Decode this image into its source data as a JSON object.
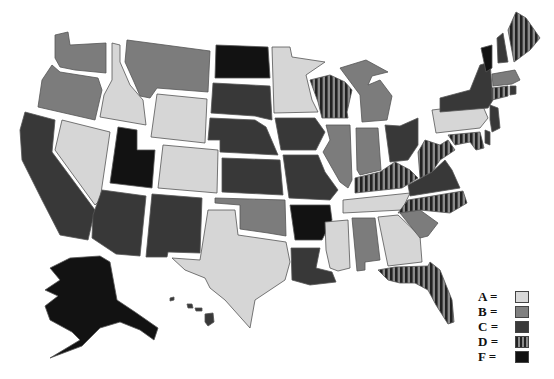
{
  "legend": {
    "items": [
      {
        "grade": "A",
        "label": "A =",
        "fill": "#d9d9d9"
      },
      {
        "grade": "B",
        "label": "B =",
        "fill": "#808080"
      },
      {
        "grade": "C",
        "label": "C =",
        "fill": "#3a3a3a"
      },
      {
        "grade": "D",
        "label": "D =",
        "fill": "url(#stripes)"
      },
      {
        "grade": "F",
        "label": "F =",
        "fill": "#111111"
      }
    ]
  },
  "colors": {
    "A": "#d6d6d6",
    "B": "#7c7c7c",
    "C": "#383838",
    "D": "url(#stripes)",
    "F": "#121212",
    "stripe_light": "#8a8a8a",
    "stripe_dark": "#222222"
  },
  "states": [
    {
      "code": "WA",
      "grade": "B",
      "points": "55,35 68,32 70,45 106,43 106,73 75,70 60,67 55,58"
    },
    {
      "code": "OR",
      "grade": "B",
      "points": "52,65 60,72 98,78 102,90 95,120 38,107 42,80"
    },
    {
      "code": "ID",
      "grade": "A",
      "points": "112,43 120,45 120,62 130,85 143,100 146,125 100,117 104,95 112,80"
    },
    {
      "code": "MT",
      "grade": "B",
      "points": "127,40 210,51 208,92 157,88 150,98 140,96 134,82 125,62"
    },
    {
      "code": "WY",
      "grade": "A",
      "points": "157,94 207,99 205,143 151,137"
    },
    {
      "code": "NV",
      "grade": "A",
      "points": "62,120 110,132 100,200 95,205 55,150"
    },
    {
      "code": "CA",
      "grade": "C",
      "points": "25,112 55,120 52,152 95,210 88,240 60,235 42,200 22,160 20,130"
    },
    {
      "code": "UT",
      "grade": "F",
      "points": "118,127 137,130 137,150 155,150 152,188 110,183"
    },
    {
      "code": "CO",
      "grade": "A",
      "points": "163,145 218,150 217,193 158,188"
    },
    {
      "code": "AZ",
      "grade": "C",
      "points": "102,190 146,196 140,256 116,254 92,238 93,215"
    },
    {
      "code": "NM",
      "grade": "C",
      "points": "152,194 202,198 200,253 168,252 167,257 146,257"
    },
    {
      "code": "ND",
      "grade": "F",
      "points": "216,45 268,47 270,78 215,78"
    },
    {
      "code": "SD",
      "grade": "C",
      "points": "213,83 270,86 272,120 263,118 255,116 211,113"
    },
    {
      "code": "NE",
      "grade": "C",
      "points": "210,118 255,120 266,127 278,155 220,152 220,140 208,140"
    },
    {
      "code": "KS",
      "grade": "C",
      "points": "222,158 280,160 283,195 222,192"
    },
    {
      "code": "OK",
      "grade": "B",
      "points": "215,198 285,200 286,236 268,233 240,229 240,205 215,203"
    },
    {
      "code": "TX",
      "grade": "A",
      "points": "208,210 235,210 238,235 286,242 290,262 285,280 255,300 250,328 225,300 210,288 205,278 185,270 172,258 200,260"
    },
    {
      "code": "MN",
      "grade": "A",
      "points": "272,47 290,47 292,57 325,62 306,75 312,100 318,112 274,113"
    },
    {
      "code": "IA",
      "grade": "C",
      "points": "275,118 315,118 325,132 316,150 281,150"
    },
    {
      "code": "MO",
      "grade": "C",
      "points": "283,155 318,155 325,172 338,190 330,200 289,198"
    },
    {
      "code": "AR",
      "grade": "F",
      "points": "290,205 330,205 332,220 322,240 295,240"
    },
    {
      "code": "LA",
      "grade": "C",
      "points": "291,248 320,248 316,268 332,272 336,282 310,285 292,280"
    },
    {
      "code": "WI",
      "grade": "D",
      "points": "310,80 330,75 345,82 352,90 347,112 348,118 322,118 318,102"
    },
    {
      "code": "IL",
      "grade": "B",
      "points": "326,125 350,125 352,180 348,188 340,182 332,168 323,152 330,140"
    },
    {
      "code": "MI",
      "grade": "B",
      "points": "340,68 366,60 388,72 372,76 368,85 380,80 392,96 387,120 362,122 360,95"
    },
    {
      "code": "IN",
      "grade": "B",
      "points": "356,128 378,128 381,170 360,175 357,170"
    },
    {
      "code": "OH",
      "grade": "C",
      "points": "385,125 400,126 418,118 418,145 408,160 390,162"
    },
    {
      "code": "KY",
      "grade": "D",
      "points": "355,178 380,172 395,162 410,170 418,178 402,188 355,193"
    },
    {
      "code": "TN",
      "grade": "A",
      "points": "343,200 410,193 402,210 343,213"
    },
    {
      "code": "MS",
      "grade": "A",
      "points": "325,222 348,220 350,268 338,271 330,268 326,250"
    },
    {
      "code": "AL",
      "grade": "B",
      "points": "352,218 375,218 380,260 365,262 365,270 357,271"
    },
    {
      "code": "GA",
      "grade": "A",
      "points": "378,217 398,215 420,236 422,262 388,266"
    },
    {
      "code": "FL",
      "grade": "D",
      "points": "378,270 395,267 428,266 430,262 440,270 452,300 454,322 448,324 436,305 428,290 415,283 400,283 388,280"
    },
    {
      "code": "SC",
      "grade": "B",
      "points": "400,213 420,210 438,223 428,236 420,238"
    },
    {
      "code": "NC",
      "grade": "D",
      "points": "408,200 463,191 467,203 450,213 420,210 398,213"
    },
    {
      "code": "VA",
      "grade": "C",
      "points": "408,185 432,172 445,160 452,170 460,188 410,196"
    },
    {
      "code": "WV",
      "grade": "D",
      "points": "418,152 425,140 440,145 448,140 455,150 440,160 432,172 420,178"
    },
    {
      "code": "PA",
      "grade": "A",
      "points": "432,110 482,104 488,118 480,128 436,133"
    },
    {
      "code": "NY",
      "grade": "C",
      "points": "440,98 470,90 480,65 490,62 493,100 488,108 440,112"
    },
    {
      "code": "VT",
      "grade": "F",
      "points": "481,48 492,45 492,68 486,72"
    },
    {
      "code": "NH",
      "grade": "C",
      "points": "497,38 503,33 508,62 498,63"
    },
    {
      "code": "ME",
      "grade": "D",
      "points": "508,30 516,12 526,18 540,38 530,50 514,62"
    },
    {
      "code": "MA",
      "grade": "B",
      "points": "492,74 515,70 520,80 512,84 493,86"
    },
    {
      "code": "CT",
      "grade": "D",
      "points": "492,88 508,86 508,96 492,100"
    },
    {
      "code": "RI",
      "grade": "C",
      "points": "510,86 516,86 516,94 510,95"
    },
    {
      "code": "NJ",
      "grade": "C",
      "points": "490,105 498,108 500,128 492,132 490,120"
    },
    {
      "code": "DE",
      "grade": "C",
      "points": "485,130 490,132 490,145 485,143"
    },
    {
      "code": "MD",
      "grade": "D",
      "points": "448,135 480,132 484,148 476,150 470,142 455,145"
    },
    {
      "code": "AK",
      "grade": "F",
      "points": "70,258 100,256 110,262 117,300 135,312 158,328 154,340 140,330 120,322 100,328 82,346 50,358 80,340 72,332 50,320 45,306 58,296 45,290 60,280 50,268"
    },
    {
      "code": "HI1",
      "grade": "C",
      "points": "170,298 174,297 174,300 170,301"
    },
    {
      "code": "HI2",
      "grade": "C",
      "points": "187,304 192,304 193,308 188,308"
    },
    {
      "code": "HI3",
      "grade": "C",
      "points": "195,308 202,308 202,311 196,311"
    },
    {
      "code": "HI4",
      "grade": "C",
      "points": "205,314 213,313 214,322 208,326 205,322"
    }
  ]
}
